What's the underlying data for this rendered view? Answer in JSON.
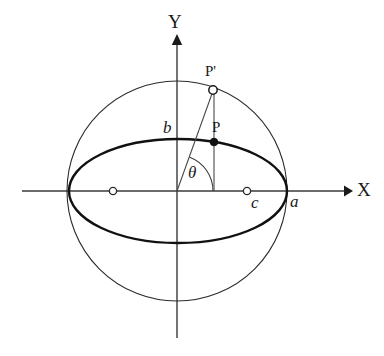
{
  "figure": {
    "type": "geometry-diagram",
    "background_color": "#ffffff",
    "stroke_color": "#1a1a1a",
    "axes": {
      "x_label": "X",
      "y_label": "Y",
      "origin": {
        "x": 177,
        "y": 191
      },
      "x_line": {
        "x1": 22,
        "y1": 191,
        "x2": 350,
        "y2": 191
      },
      "y_line": {
        "x1": 177,
        "y1": 38,
        "x2": 177,
        "y2": 338
      },
      "arrow_style": "filled-triangle"
    },
    "circle": {
      "name": "auxiliary-circle",
      "cx": 177,
      "cy": 191,
      "r": 110,
      "stroke_width": 1.1
    },
    "ellipse": {
      "name": "ellipse",
      "cx": 178,
      "cy": 191,
      "rx": 109,
      "ry": 52,
      "stroke_width": 2.4
    },
    "points": [
      {
        "id": "P-prime",
        "label": "P'",
        "marker": "open-circle",
        "x": 213,
        "y": 90,
        "label_x": 205,
        "label_y": 64
      },
      {
        "id": "P",
        "label": "P",
        "marker": "filled-dot",
        "x": 214,
        "y": 142,
        "label_x": 212,
        "label_y": 120
      },
      {
        "id": "focus-right",
        "label": "",
        "marker": "open-circle",
        "x": 247,
        "y": 191
      },
      {
        "id": "focus-left",
        "label": "",
        "marker": "open-circle",
        "x": 113,
        "y": 191
      }
    ],
    "segments": [
      {
        "id": "origin-to-P-prime",
        "x1": 177,
        "y1": 191,
        "x2": 213,
        "y2": 90
      },
      {
        "id": "P-prime-vertical-drop",
        "x1": 214,
        "y1": 90,
        "x2": 214,
        "y2": 191
      }
    ],
    "angle": {
      "id": "theta",
      "label": "θ",
      "vertex_x": 177,
      "vertex_y": 191,
      "radius": 36,
      "label_x": 188,
      "label_y": 164
    },
    "labels": [
      {
        "id": "semi-minor-axis",
        "text": "b",
        "x": 163,
        "y": 119,
        "style": "italic"
      },
      {
        "id": "semi-major-axis",
        "text": "a",
        "x": 290,
        "y": 193,
        "style": "italic"
      },
      {
        "id": "focal-distance",
        "text": "c",
        "x": 251,
        "y": 194,
        "style": "italic"
      },
      {
        "id": "x-axis-label",
        "text": "X",
        "x": 357,
        "y": 180,
        "style": "axis"
      },
      {
        "id": "y-axis-label",
        "text": "Y",
        "x": 168,
        "y": 12,
        "style": "axis"
      }
    ]
  }
}
